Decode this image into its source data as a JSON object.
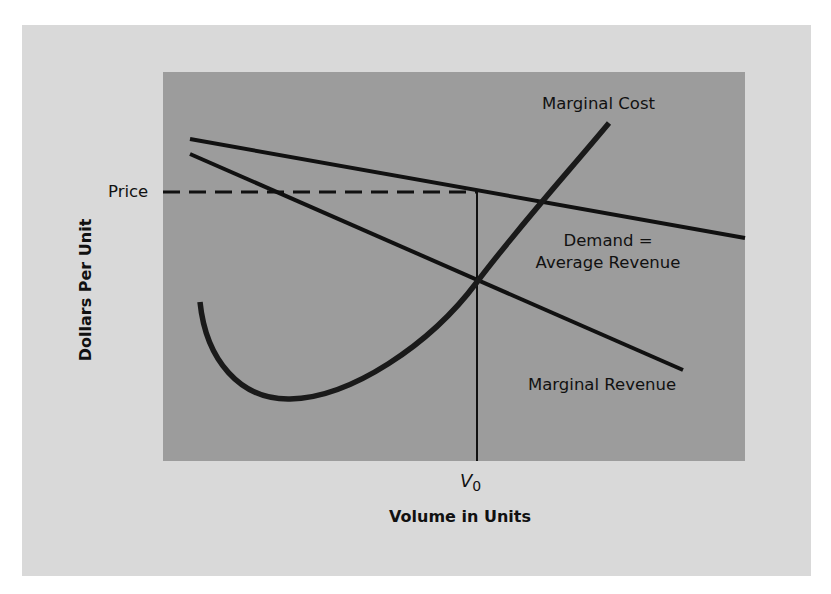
{
  "diagram": {
    "type": "economics-profit-maximization",
    "y_axis_label": "Dollars Per Unit",
    "x_axis_label": "Volume in Units",
    "price_label": "Price",
    "volume_marker": {
      "symbol": "V",
      "subscript": "0"
    },
    "curves": {
      "marginal_cost": "Marginal Cost",
      "demand_line1": "Demand =",
      "demand_line2": "Average Revenue",
      "marginal_revenue": "Marginal Revenue"
    },
    "colors": {
      "outer_background": "#d9d9d9",
      "plot_background": "#9c9c9c",
      "lines": "#111111"
    }
  }
}
